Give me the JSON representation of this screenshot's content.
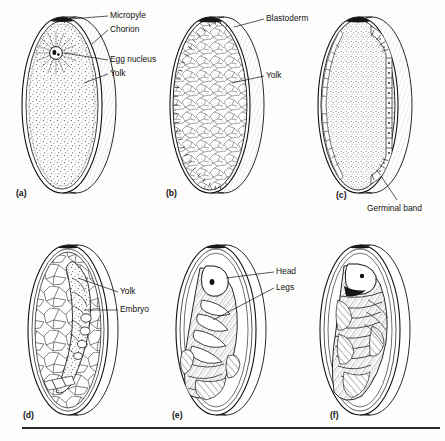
{
  "figure": {
    "background_color": "#fdfdfc",
    "ink_color": "#111111",
    "panel_count": 6
  },
  "panels": [
    {
      "letter": "(a)",
      "stage": "newly-laid egg",
      "labels": [
        "Micropyle",
        "Chorion",
        "Egg nucleus",
        "Yolk"
      ],
      "features": [
        "micropyle cap",
        "chorion rim",
        "radiating egg nucleus",
        "stippled yolk"
      ]
    },
    {
      "letter": "(b)",
      "stage": "blastoderm formation",
      "labels": [
        "Blastoderm",
        "Yolk"
      ],
      "features": [
        "hatched blastoderm rim",
        "reticulated yolk"
      ]
    },
    {
      "letter": "(c)",
      "stage": "germinal band",
      "labels": [
        "Germinal band"
      ],
      "features": [
        "segmented germinal band",
        "stippled yolk"
      ]
    },
    {
      "letter": "(d)",
      "stage": "embryo with yolk cells",
      "labels": [
        "Yolk",
        "Embryo"
      ],
      "features": [
        "polygonal yolk cells",
        "developing embryo"
      ]
    },
    {
      "letter": "(e)",
      "stage": "differentiated embryo",
      "labels": [
        "Head",
        "Legs"
      ],
      "features": [
        "head with eye spot",
        "segmented legs"
      ]
    },
    {
      "letter": "(f)",
      "stage": "fully formed larva",
      "labels": [],
      "features": [
        "coiled larva",
        "body segments"
      ]
    }
  ],
  "label_text": {
    "micropyle": "Micropyle",
    "chorion": "Chorion",
    "egg_nucleus": "Egg nucleus",
    "yolk_a": "Yolk",
    "blastoderm": "Blastoderm",
    "yolk_b": "Yolk",
    "germinal_band": "Germinal band",
    "yolk_d": "Yolk",
    "embryo": "Embryo",
    "head": "Head",
    "legs": "Legs"
  },
  "panel_letters": {
    "a": "(a)",
    "b": "(b)",
    "c": "(c)",
    "d": "(d)",
    "e": "(e)",
    "f": "(f)"
  }
}
